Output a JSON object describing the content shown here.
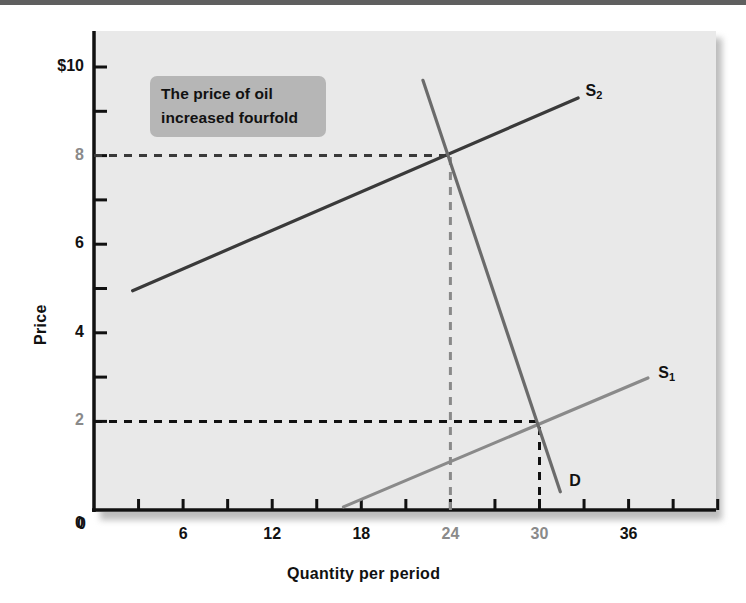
{
  "figure": {
    "background_color": "#ffffff",
    "plot_background_color": "#e9e9e9",
    "top_rule_color": "#5f5f5f"
  },
  "annotation": {
    "line1": "The price of oil",
    "line2": "increased fourfold",
    "background_color": "#b6b6b6",
    "text_color": "#111111"
  },
  "chart_data": {
    "type": "line",
    "title": "",
    "xlabel": "Quantity per period",
    "ylabel": "Price",
    "xlim": [
      0,
      42
    ],
    "ylim": [
      0,
      10.8
    ],
    "grid": false,
    "legend": "inline-curve-labels",
    "x_ticks_major": [
      {
        "value": 0,
        "label": "0",
        "color": "#111111"
      },
      {
        "value": 6,
        "label": "6",
        "color": "#111111"
      },
      {
        "value": 12,
        "label": "12",
        "color": "#111111"
      },
      {
        "value": 18,
        "label": "18",
        "color": "#111111"
      },
      {
        "value": 24,
        "label": "24",
        "color": "#8a8a8a"
      },
      {
        "value": 30,
        "label": "30",
        "color": "#8a8a8a"
      },
      {
        "value": 36,
        "label": "36",
        "color": "#111111"
      }
    ],
    "x_ticks_minor": [
      3,
      9,
      15,
      21,
      27,
      33,
      39,
      42
    ],
    "y_ticks_major": [
      {
        "value": 10,
        "label": "$10",
        "color": "#111111"
      },
      {
        "value": 8,
        "label": "8",
        "color": "#8a8a8a"
      },
      {
        "value": 6,
        "label": "6",
        "color": "#111111"
      },
      {
        "value": 4,
        "label": "4",
        "color": "#111111"
      },
      {
        "value": 2,
        "label": "2",
        "color": "#8a8a8a"
      },
      {
        "value": 0,
        "label": "0",
        "color": "#111111"
      }
    ],
    "y_ticks_minor": [
      9,
      7,
      5,
      3
    ],
    "series": [
      {
        "name": "S2",
        "label": "S",
        "sublabel": "2",
        "role": "supply-after-shock",
        "color": "#3a3a3a",
        "x": [
          2.6,
          32.6
        ],
        "y": [
          4.95,
          9.3
        ],
        "label_x": 33.1,
        "label_y": 9.45
      },
      {
        "name": "S1",
        "label": "S",
        "sublabel": "1",
        "role": "supply-before-shock",
        "color": "#8a8a8a",
        "x": [
          16.8,
          37.3
        ],
        "y": [
          0.07,
          2.98
        ],
        "label_x": 38.0,
        "label_y": 3.1
      },
      {
        "name": "D",
        "label": "D",
        "sublabel": "",
        "role": "demand",
        "color": "#6b6b6b",
        "x": [
          22.15,
          31.4
        ],
        "y": [
          9.7,
          0.41
        ],
        "label_x": 32.0,
        "label_y": 0.65
      }
    ],
    "equilibria": [
      {
        "name": "initial-equilibrium",
        "quantity": 30,
        "price": 2,
        "curves": [
          "S1",
          "D"
        ]
      },
      {
        "name": "new-equilibrium",
        "quantity": 24,
        "price": 8,
        "curves": [
          "S2",
          "D"
        ]
      }
    ],
    "guide_lines": [
      {
        "name": "price-8-guide",
        "orientation": "horizontal",
        "value": 8,
        "from": 0,
        "to": 24,
        "color": "#3a3a3a",
        "style": "dashed"
      },
      {
        "name": "quantity-24-guide",
        "orientation": "vertical",
        "value": 24,
        "from": 0,
        "to": 8,
        "color": "#8a8a8a",
        "style": "dashed"
      },
      {
        "name": "price-2-guide",
        "orientation": "horizontal",
        "value": 2,
        "from": 0,
        "to": 30,
        "color": "#111111",
        "style": "dashed"
      },
      {
        "name": "quantity-30-guide",
        "orientation": "vertical",
        "value": 30,
        "from": 0,
        "to": 2,
        "color": "#111111",
        "style": "dashed"
      }
    ]
  }
}
